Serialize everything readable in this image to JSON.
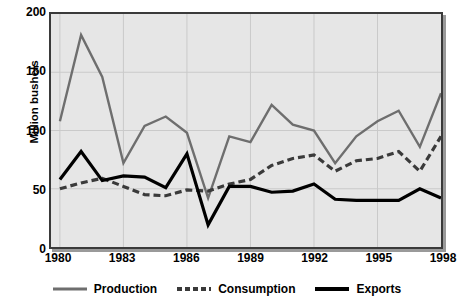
{
  "chart_data": {
    "type": "line",
    "title": "",
    "xlabel": "",
    "ylabel": "Million bushels",
    "grid": true,
    "legend_position": "bottom",
    "xlim": [
      1980,
      1998
    ],
    "ylim": [
      0,
      200
    ],
    "y_ticks": [
      200,
      150,
      100,
      50,
      0
    ],
    "x_ticks": [
      1980,
      1983,
      1986,
      1989,
      1992,
      1995,
      1998
    ],
    "x": [
      1980,
      1981,
      1982,
      1983,
      1984,
      1985,
      1986,
      1987,
      1988,
      1989,
      1990,
      1991,
      1992,
      1993,
      1994,
      1995,
      1996,
      1997,
      1998
    ],
    "categories": [
      "1980",
      "1981",
      "1982",
      "1983",
      "1984",
      "1985",
      "1986",
      "1987",
      "1988",
      "1989",
      "1990",
      "1991",
      "1992",
      "1993",
      "1994",
      "1995",
      "1996",
      "1997",
      "1998"
    ],
    "series": [
      {
        "name": "Production",
        "style": "solid",
        "color": "#6e6e6e",
        "width": 2.4,
        "values": [
          108,
          182,
          146,
          72,
          104,
          112,
          98,
          42,
          95,
          90,
          122,
          105,
          100,
          72,
          95,
          108,
          117,
          86,
          132
        ]
      },
      {
        "name": "Consumption",
        "style": "dashed",
        "color": "#3a3a3a",
        "width": 3.2,
        "values": [
          50,
          55,
          59,
          52,
          45,
          44,
          49,
          48,
          54,
          58,
          70,
          76,
          79,
          65,
          74,
          76,
          82,
          65,
          95
        ]
      },
      {
        "name": "Exports",
        "style": "solid",
        "color": "#000000",
        "width": 3.2,
        "values": [
          58,
          82,
          57,
          61,
          60,
          51,
          80,
          19,
          52,
          52,
          47,
          48,
          54,
          41,
          40,
          40,
          40,
          50,
          42
        ]
      }
    ]
  },
  "axes": {
    "y_title": "Million bushels",
    "y_tick_labels": [
      "200",
      "150",
      "100",
      "50",
      "0"
    ],
    "x_tick_labels": [
      "1980",
      "1983",
      "1986",
      "1989",
      "1992",
      "1995",
      "1998"
    ]
  },
  "legend": {
    "items": [
      {
        "label": "Production",
        "icon": "line-solid-gray-icon"
      },
      {
        "label": "Consumption",
        "icon": "line-dashed-dark-icon"
      },
      {
        "label": "Exports",
        "icon": "line-solid-black-icon"
      }
    ]
  },
  "colors": {
    "plot_background": "#e6e6e6",
    "plot_border": "#3a3a3a",
    "gridline": "#c9c9c9",
    "production": "#6e6e6e",
    "consumption": "#3a3a3a",
    "exports": "#000000",
    "page_background": "#ffffff"
  }
}
